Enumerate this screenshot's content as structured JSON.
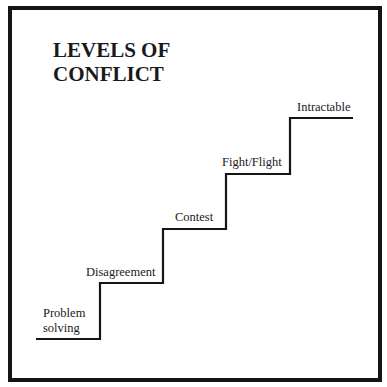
{
  "title": {
    "line1": "LEVELS OF",
    "line2": "CONFLICT"
  },
  "steps": [
    {
      "label_line1": "Problem",
      "label_line2": "solving"
    },
    {
      "label": "Disagreement"
    },
    {
      "label": "Contest"
    },
    {
      "label": "Fight/Flight"
    },
    {
      "label": "Intractable"
    }
  ],
  "colors": {
    "line": "#151515",
    "background": "#ffffff"
  }
}
